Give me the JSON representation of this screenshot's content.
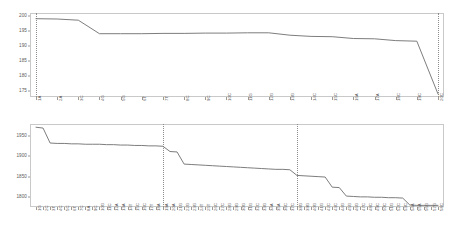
{
  "figure": {
    "background": "#ffffff",
    "line_color": "#6e6e6e",
    "axis_color": "#c9c9c9",
    "marker_line_color": "#8d8d8d"
  },
  "chart_data": [
    {
      "type": "line",
      "id": "top-chart",
      "title": "",
      "xlabel": "",
      "ylabel": "",
      "ylim": [
        173,
        201
      ],
      "yticks": [
        175,
        180,
        185,
        190,
        195,
        200
      ],
      "ytick_labels": [
        "175",
        "180",
        "185",
        "190",
        "195",
        "200"
      ],
      "grid": false,
      "legend": "none",
      "categories": [
        "1A",
        "2A",
        "3C",
        "4G",
        "5G",
        "6T",
        "7T",
        "8C",
        "9C",
        "10C",
        "11G",
        "12G",
        "13G",
        "14C",
        "15C",
        "16A",
        "17A",
        "18C",
        "19C",
        "20C"
      ],
      "values": [
        199.1,
        199.0,
        198.6,
        194.1,
        194.1,
        194.1,
        194.2,
        194.2,
        194.3,
        194.3,
        194.4,
        194.4,
        193.6,
        193.2,
        193.1,
        192.5,
        192.4,
        191.8,
        191.6,
        174.0
      ],
      "vertical_markers": [
        "1A",
        "20C"
      ]
    },
    {
      "type": "line",
      "id": "bottom-chart",
      "title": "",
      "xlabel": "",
      "ylabel": "",
      "ylim": [
        1775,
        1980
      ],
      "yticks": [
        1800,
        1850,
        1900,
        1950
      ],
      "ytick_labels": [
        "1800",
        "1850",
        "1900",
        "1950"
      ],
      "grid": false,
      "legend": "none",
      "categories": [
        "1G",
        "2C",
        "3T",
        "4C",
        "5C",
        "6T",
        "7C",
        "8A",
        "9C",
        "10G",
        "11C",
        "12A",
        "13A",
        "14T",
        "15C",
        "16C",
        "17T",
        "18A",
        "19A",
        "20A",
        "21G",
        "22G",
        "23G",
        "24T",
        "25T",
        "26C",
        "27C",
        "28G",
        "29G",
        "30G",
        "31G",
        "32C",
        "33G",
        "34A",
        "35A",
        "36C",
        "37C",
        "38G",
        "39G",
        "40G",
        "41G",
        "42C",
        "43C",
        "44G",
        "45G",
        "46G",
        "47C",
        "48C",
        "49C",
        "50C",
        "51G",
        "52C",
        "53C",
        "54A",
        "55A",
        "56G",
        "57G",
        "58C"
      ],
      "values": [
        1972,
        1970,
        1933,
        1932,
        1932,
        1931,
        1931,
        1930,
        1930,
        1930,
        1929,
        1929,
        1928,
        1928,
        1927,
        1927,
        1926,
        1926,
        1925,
        1912,
        1911,
        1881,
        1880,
        1879,
        1878,
        1877,
        1876,
        1875,
        1874,
        1873,
        1872,
        1871,
        1870,
        1869,
        1868,
        1868,
        1867,
        1853,
        1852,
        1851,
        1850,
        1849,
        1824,
        1823,
        1802,
        1801,
        1800,
        1800,
        1799,
        1799,
        1798,
        1798,
        1797,
        1780,
        1779,
        1779,
        1779,
        1779
      ],
      "vertical_markers": [
        "19A",
        "38G"
      ]
    }
  ]
}
